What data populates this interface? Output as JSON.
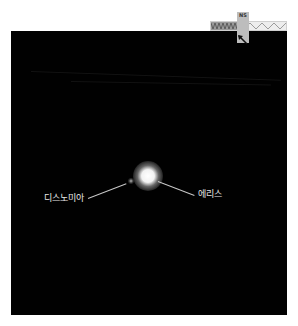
{
  "image": {
    "description": "Astronomical image of dwarf planet Eris with its moon Dysnomia against black space",
    "background_color": "#010101",
    "page_background": "#ffffff"
  },
  "labels": {
    "moon": "디스노미아",
    "planet": "에리스"
  },
  "compass": {
    "label": "NS",
    "icon": "compass-arrow-icon"
  },
  "scale_bar": {
    "icon": "scale-bar-icon"
  },
  "colors": {
    "label_text": "#e8e8e8",
    "pointer_line": "#c8c8c8",
    "overlay_box": "#bdbdbd"
  }
}
